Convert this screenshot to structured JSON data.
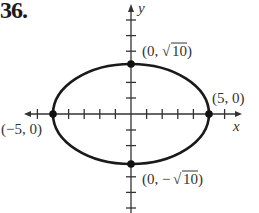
{
  "problem": {
    "number": "36."
  },
  "axes": {
    "x_label": "x",
    "y_label": "y",
    "x_ticks": [
      -6,
      -5,
      -4,
      -3,
      -2,
      -1,
      1,
      2,
      3,
      4,
      5,
      6
    ],
    "y_ticks": [
      -6,
      -5,
      -4,
      -3,
      -2,
      -1,
      1,
      2,
      3,
      4,
      5,
      6
    ]
  },
  "ellipse": {
    "center": [
      0,
      0
    ],
    "a": 5,
    "b": 3.1623,
    "stroke_color": "#1a1a1a"
  },
  "points": [
    {
      "name": "top-vertex",
      "label": "(0, √10)",
      "x": 0,
      "y": 3.1623
    },
    {
      "name": "right-vertex",
      "label": "(5, 0)",
      "x": 5,
      "y": 0
    },
    {
      "name": "left-vertex",
      "label": "(−5, 0)",
      "x": -5,
      "y": 0
    },
    {
      "name": "bottom-vertex",
      "label": "(0, −√10)",
      "x": 0,
      "y": -3.1623
    }
  ],
  "labels": {
    "top": {
      "prefix": "(0, ",
      "radicand": "10",
      "suffix": ")"
    },
    "bottom": {
      "prefix": "(0, −",
      "radicand": "10",
      "suffix": ")"
    },
    "right": "(5, 0)",
    "left": "(−5, 0)"
  }
}
